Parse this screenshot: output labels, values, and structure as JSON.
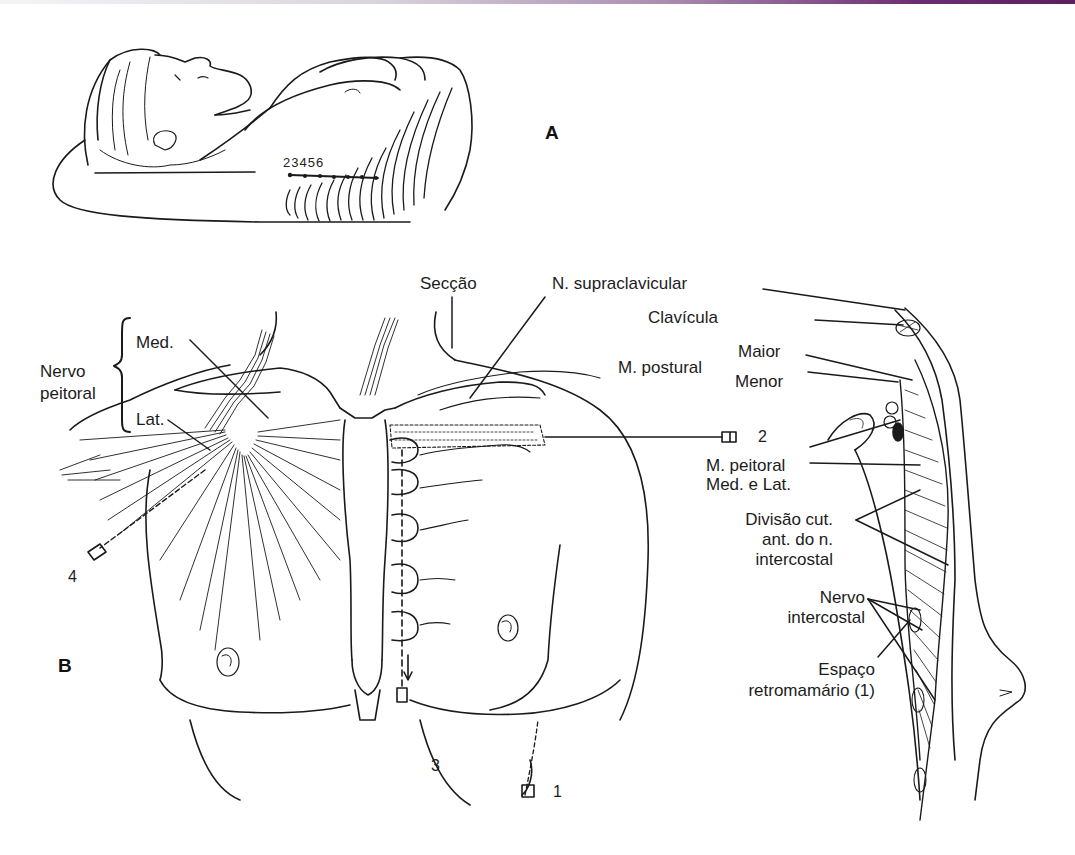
{
  "figure": {
    "top_bar_color_end": "#5a1f60",
    "panels": {
      "a": "A",
      "b": "B"
    },
    "panel_a": {
      "rib_numbers": "23456"
    },
    "labels": {
      "seccao": "Secção",
      "n_supraclavicular": "N. supraclavicular",
      "clavicula": "Clavícula",
      "m_postural": "M. postural",
      "maior": "Maior",
      "menor": "Menor",
      "nervo_peitoral_line1": "Nervo",
      "nervo_peitoral_line2": "peitoral",
      "med": "Med.",
      "lat": "Lat.",
      "m_peitoral_line1": "M. peitoral",
      "m_peitoral_line2": "Med. e Lat.",
      "divisao_line1": "Divisão cut.",
      "divisao_line2": "ant. do n.",
      "divisao_line3": "intercostal",
      "nervo_intercostal_line1": "Nervo",
      "nervo_intercostal_line2": "intercostal",
      "espaco_line1": "Espaço",
      "espaco_line2": "retromamário (1)"
    },
    "needle_numbers": {
      "n1": "1",
      "n2": "2",
      "n3": "3",
      "n4": "4"
    }
  }
}
